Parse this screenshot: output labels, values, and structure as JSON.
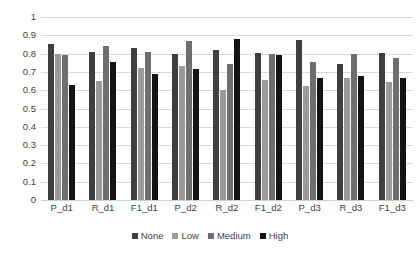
{
  "chart_data": {
    "type": "bar",
    "title": "",
    "xlabel": "",
    "ylabel": "",
    "ylim": [
      0,
      1
    ],
    "yticks": [
      "0",
      "0.1",
      "0.2",
      "0.3",
      "0.4",
      "0.5",
      "0.6",
      "0.7",
      "0.8",
      "0.9",
      "1"
    ],
    "grid": true,
    "legend_position": "bottom",
    "categories": [
      "P_d1",
      "R_d1",
      "F1_d1",
      "P_d2",
      "R_d2",
      "F1_d2",
      "P_d3",
      "R_d3",
      "F1_d3"
    ],
    "series": [
      {
        "name": "None",
        "color": "#3f3f3f",
        "values": [
          0.855,
          0.81,
          0.83,
          0.8,
          0.82,
          0.805,
          0.875,
          0.745,
          0.805
        ]
      },
      {
        "name": "Low",
        "color": "#9a9a9a",
        "values": [
          0.8,
          0.65,
          0.72,
          0.735,
          0.6,
          0.655,
          0.625,
          0.665,
          0.645
        ]
      },
      {
        "name": "Medium",
        "color": "#6e6e6e",
        "values": [
          0.79,
          0.84,
          0.81,
          0.87,
          0.745,
          0.8,
          0.755,
          0.8,
          0.775
        ]
      },
      {
        "name": "High",
        "color": "#141414",
        "values": [
          0.63,
          0.755,
          0.69,
          0.715,
          0.88,
          0.79,
          0.665,
          0.68,
          0.665
        ]
      }
    ]
  }
}
